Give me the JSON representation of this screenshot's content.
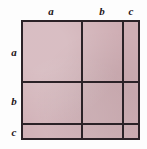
{
  "figure": {
    "title": "",
    "colors": {
      "fill": "#cfaeb4",
      "line": "#2b2227",
      "background": "#fdfdfd",
      "label": "#1d1418"
    }
  },
  "column_labels": [
    {
      "id": "a",
      "text": "a"
    },
    {
      "id": "b",
      "text": "b"
    },
    {
      "id": "c",
      "text": "c"
    }
  ],
  "row_labels": [
    {
      "id": "a",
      "text": "a"
    },
    {
      "id": "b",
      "text": "b"
    },
    {
      "id": "c",
      "text": "c"
    }
  ],
  "chart_data": {
    "type": "area",
    "title": "",
    "subtitle": "",
    "xlabel": "",
    "ylabel": "",
    "grid": true,
    "legend": null,
    "categories": [
      "a",
      "b",
      "c"
    ],
    "series": [
      {
        "name": "row a",
        "values": [
          "a",
          "b",
          "c"
        ]
      },
      {
        "name": "row b",
        "values": [
          "a",
          "b",
          "c"
        ]
      },
      {
        "name": "row c",
        "values": [
          "a",
          "b",
          "c"
        ]
      }
    ],
    "annotations": [
      "a",
      "b",
      "c",
      "a",
      "b",
      "c"
    ]
  }
}
